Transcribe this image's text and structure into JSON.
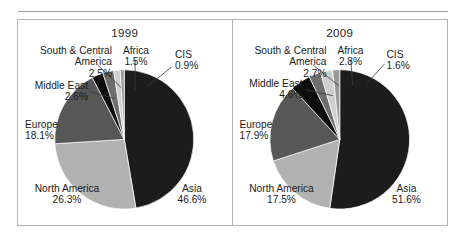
{
  "figure": {
    "panels": [
      {
        "title": "1999",
        "slices": [
          {
            "name": "Asia",
            "pct": "46.6%",
            "value": 46.6,
            "color": "#1c1c1c"
          },
          {
            "name": "North America",
            "pct": "26.3%",
            "value": 26.3,
            "color": "#b2b2b2"
          },
          {
            "name": "Europe",
            "pct": "18.1%",
            "value": 18.1,
            "color": "#575757"
          },
          {
            "name": "Middle East",
            "pct": "2.6%",
            "value": 2.6,
            "color": "#0d0d0d"
          },
          {
            "name": "South & Central America",
            "pct": "2.5%",
            "value": 2.5,
            "color": "#6e6e6e"
          },
          {
            "name": "Africa",
            "pct": "1.5%",
            "value": 1.5,
            "color": "#cfcfcf"
          },
          {
            "name": "CIS",
            "pct": "0.9%",
            "value": 0.9,
            "color": "#9a9a9a"
          }
        ]
      },
      {
        "title": "2009",
        "slices": [
          {
            "name": "Asia",
            "pct": "51.6%",
            "value": 51.6,
            "color": "#1c1c1c"
          },
          {
            "name": "North America",
            "pct": "17.5%",
            "value": 17.5,
            "color": "#b2b2b2"
          },
          {
            "name": "Europe",
            "pct": "17.9%",
            "value": 17.9,
            "color": "#575757"
          },
          {
            "name": "Middle East",
            "pct": "4.6%",
            "value": 4.6,
            "color": "#0d0d0d"
          },
          {
            "name": "South & Central America",
            "pct": "2.7%",
            "value": 2.7,
            "color": "#6e6e6e"
          },
          {
            "name": "Africa",
            "pct": "2.8%",
            "value": 2.8,
            "color": "#cfcfcf"
          },
          {
            "name": "CIS",
            "pct": "1.6%",
            "value": 1.6,
            "color": "#9a9a9a"
          }
        ]
      }
    ],
    "labels_1999": {
      "sca_name_1": "South & Central",
      "sca_name_2": "America",
      "sca_pct": "2.5%",
      "africa_name": "Africa",
      "africa_pct": "1.5%",
      "cis_name": "CIS",
      "cis_pct": "0.9%",
      "me_name": "Middle East",
      "me_pct": "2.6%",
      "eu_name": "Europe",
      "eu_pct": "18.1%",
      "na_name": "North America",
      "na_pct": "26.3%",
      "asia_name": "Asia",
      "asia_pct": "46.6%"
    },
    "labels_2009": {
      "sca_name_1": "South & Central",
      "sca_name_2": "America",
      "sca_pct": "2.7%",
      "africa_name": "Africa",
      "africa_pct": "2.8%",
      "cis_name": "CIS",
      "cis_pct": "1.6%",
      "me_name": "Middle East",
      "me_pct": "4.6%",
      "eu_name": "Europe",
      "eu_pct": "17.9%",
      "na_name": "North America",
      "na_pct": "17.5%",
      "asia_name": "Asia",
      "asia_pct": "51.6%"
    }
  },
  "chart_data": [
    {
      "type": "pie",
      "title": "1999",
      "categories": [
        "Asia",
        "North America",
        "Europe",
        "Middle East",
        "South & Central America",
        "Africa",
        "CIS"
      ],
      "values": [
        46.6,
        26.3,
        18.1,
        2.6,
        2.5,
        1.5,
        0.9
      ],
      "unit": "%",
      "labels": [
        "46.6%",
        "26.3%",
        "18.1%",
        "2.6%",
        "2.5%",
        "1.5%",
        "0.9%"
      ],
      "colors": [
        "#1c1c1c",
        "#b2b2b2",
        "#575757",
        "#0d0d0d",
        "#6e6e6e",
        "#cfcfcf",
        "#9a9a9a"
      ],
      "start_angle_deg": 0,
      "direction": "clockwise",
      "legend": "none",
      "grid": false
    },
    {
      "type": "pie",
      "title": "2009",
      "categories": [
        "Asia",
        "North America",
        "Europe",
        "Middle East",
        "South & Central America",
        "Africa",
        "CIS"
      ],
      "values": [
        51.6,
        17.5,
        17.9,
        4.6,
        2.7,
        2.8,
        1.6
      ],
      "unit": "%",
      "labels": [
        "51.6%",
        "17.5%",
        "17.9%",
        "4.6%",
        "2.7%",
        "2.8%",
        "1.6%"
      ],
      "colors": [
        "#1c1c1c",
        "#b2b2b2",
        "#575757",
        "#0d0d0d",
        "#6e6e6e",
        "#cfcfcf",
        "#9a9a9a"
      ],
      "start_angle_deg": 0,
      "direction": "clockwise",
      "legend": "none",
      "grid": false
    }
  ]
}
